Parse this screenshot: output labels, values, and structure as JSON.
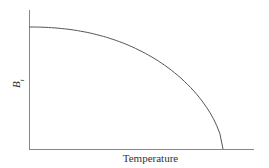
{
  "chart_data": {
    "type": "line",
    "title": "",
    "xlabel": "Temperature",
    "ylabel": "B",
    "ylabel_subscript": "t",
    "grid": false,
    "legend": null,
    "series": [
      {
        "name": "B_t vs Temperature",
        "x": [
          0.0,
          0.1,
          0.2,
          0.3,
          0.4,
          0.5,
          0.6,
          0.7,
          0.8,
          0.9,
          0.95,
          1.0
        ],
        "y": [
          1.0,
          0.99,
          0.96,
          0.91,
          0.84,
          0.75,
          0.64,
          0.51,
          0.36,
          0.19,
          0.1,
          0.0
        ]
      }
    ],
    "xlim": [
      0,
      1.16
    ],
    "ylim": [
      0,
      1.14
    ],
    "colors": {
      "axis": "#777777",
      "curve": "#555555"
    }
  }
}
